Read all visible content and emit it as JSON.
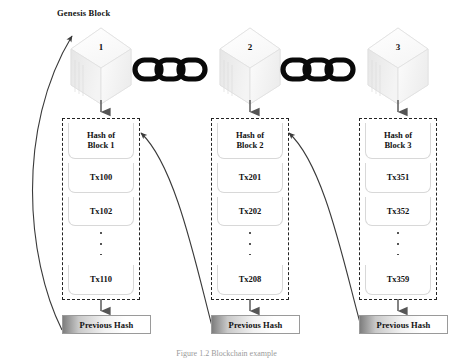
{
  "figure": {
    "title_label": "Genesis Block",
    "caption": "Figure 1.2 Blockchain example"
  },
  "chain_links": {
    "link_icon": "chain-link-icon",
    "groups": 2,
    "links_per_group": 3
  },
  "blocks": [
    {
      "cube_number": "1",
      "hash_line1": "Hash of",
      "hash_line2": "Block 1",
      "transactions": [
        "Tx100",
        "Tx102"
      ],
      "last_transaction": "Tx110",
      "previous_hash_label": "Previous Hash"
    },
    {
      "cube_number": "2",
      "hash_line1": "Hash of",
      "hash_line2": "Block 2",
      "transactions": [
        "Tx201",
        "Tx202"
      ],
      "last_transaction": "Tx208",
      "previous_hash_label": "Previous Hash"
    },
    {
      "cube_number": "3",
      "hash_line1": "Hash of",
      "hash_line2": "Block 3",
      "transactions": [
        "Tx351",
        "Tx352"
      ],
      "last_transaction": "Tx359",
      "previous_hash_label": "Previous Hash"
    }
  ],
  "colors": {
    "ink": "#111111",
    "dashed_border": "#222222",
    "cell_border": "#d8d8d8",
    "arrow": "#3a3a3a",
    "prev_hash_dark": "#7e7e7e",
    "cube_face": "#fdfdfd",
    "cube_shade": "#ededed",
    "caption": "#9b9b9b"
  }
}
